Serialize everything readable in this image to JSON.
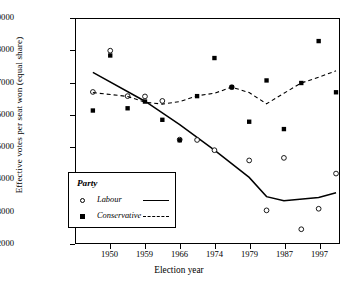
{
  "chart_data": {
    "type": "scatter",
    "title": "",
    "xlabel": "Election year",
    "ylabel": "Effective votes per seat won (equal share)",
    "ylim": [
      12000,
      19000
    ],
    "ytick_values": [
      12000,
      13000,
      14000,
      15000,
      16000,
      17000,
      18000,
      19000
    ],
    "ytick_labels": [
      "12000",
      "13000",
      "14000",
      "15000",
      "16000",
      "17000",
      "18000",
      "19000"
    ],
    "xtick_labels": [
      "1950",
      "1959",
      "1966",
      "1974",
      "1979",
      "1987",
      "1997"
    ],
    "xtick_index": [
      1,
      3,
      5,
      7,
      9,
      11,
      13
    ],
    "x_categories": [
      "1945",
      "1950",
      "1951",
      "1955",
      "1959",
      "1964",
      "1966",
      "1970",
      "1974F",
      "1974O",
      "1979",
      "1983",
      "1987",
      "1992",
      "1997"
    ],
    "grid": false,
    "legend_position": "lower-left",
    "legend_title": "Party",
    "series": [
      {
        "name": "Labour",
        "marker": "open-circle",
        "line_style": "solid",
        "points": [
          {
            "xi": 0,
            "year": "1945",
            "value": 16720
          },
          {
            "xi": 1,
            "year": "1950",
            "value": 18010
          },
          {
            "xi": 2,
            "year": "1951",
            "value": 16590
          },
          {
            "xi": 3,
            "year": "1959",
            "value": 16580
          },
          {
            "xi": 4,
            "year": "1959",
            "value": 16440
          },
          {
            "xi": 5,
            "year": "1964",
            "value": 15230
          },
          {
            "xi": 6,
            "year": "1966",
            "value": 15220
          },
          {
            "xi": 7,
            "year": "1970",
            "value": 14900
          },
          {
            "xi": 8,
            "year": "1974",
            "value": 16870
          },
          {
            "xi": 9,
            "year": "1974",
            "value": 14580
          },
          {
            "xi": 10,
            "year": "1979",
            "value": 13020
          },
          {
            "xi": 11,
            "year": "1983",
            "value": 14660
          },
          {
            "xi": 12,
            "year": "1987",
            "value": 12430
          },
          {
            "xi": 13,
            "year": "1992",
            "value": 13070
          },
          {
            "xi": 14,
            "year": "1997",
            "value": 14170
          },
          {
            "xi": 15,
            "year": "1997",
            "value": 13320
          }
        ],
        "trend": [
          {
            "xi": 0,
            "value": 17330
          },
          {
            "xi": 3,
            "value": 16430
          },
          {
            "xi": 5,
            "value": 15700
          },
          {
            "xi": 7,
            "value": 14900
          },
          {
            "xi": 9,
            "value": 14050
          },
          {
            "xi": 10,
            "value": 13450
          },
          {
            "xi": 11,
            "value": 13320
          },
          {
            "xi": 13,
            "value": 13420
          },
          {
            "xi": 14,
            "value": 13570
          }
        ]
      },
      {
        "name": "Conservative",
        "marker": "filled-square",
        "line_style": "dashed",
        "points": [
          {
            "xi": 0,
            "year": "1945",
            "value": 16140
          },
          {
            "xi": 1,
            "year": "1950",
            "value": 17860
          },
          {
            "xi": 2,
            "year": "1951",
            "value": 16210
          },
          {
            "xi": 3,
            "year": "1959",
            "value": 16420
          },
          {
            "xi": 4,
            "year": "1964",
            "value": 15850
          },
          {
            "xi": 5,
            "year": "1966",
            "value": 15210
          },
          {
            "xi": 6,
            "year": "1966",
            "value": 16590
          },
          {
            "xi": 7,
            "year": "1970",
            "value": 17780
          },
          {
            "xi": 8,
            "year": "1974",
            "value": 16870
          },
          {
            "xi": 9,
            "year": "1974",
            "value": 15790
          },
          {
            "xi": 10,
            "year": "1979",
            "value": 17080
          },
          {
            "xi": 11,
            "year": "1983",
            "value": 15560
          },
          {
            "xi": 12,
            "year": "1987",
            "value": 17000
          },
          {
            "xi": 13,
            "year": "1992",
            "value": 18310
          },
          {
            "xi": 14,
            "year": "1997",
            "value": 16710
          }
        ],
        "trend": [
          {
            "xi": 0,
            "value": 16700
          },
          {
            "xi": 2,
            "value": 16580
          },
          {
            "xi": 3,
            "value": 16400
          },
          {
            "xi": 4,
            "value": 16340
          },
          {
            "xi": 5,
            "value": 16420
          },
          {
            "xi": 6,
            "value": 16600
          },
          {
            "xi": 7,
            "value": 16680
          },
          {
            "xi": 8,
            "value": 16870
          },
          {
            "xi": 9,
            "value": 16700
          },
          {
            "xi": 10,
            "value": 16350
          },
          {
            "xi": 11,
            "value": 16680
          },
          {
            "xi": 12,
            "value": 17000
          },
          {
            "xi": 13,
            "value": 17180
          },
          {
            "xi": 14,
            "value": 17380
          }
        ]
      }
    ]
  },
  "axes": {
    "x_title": "Election year",
    "y_title": "Effective votes per seat won (equal share)"
  },
  "legend": {
    "title": "Party",
    "entries": [
      {
        "label": "Labour",
        "marker": "open-circle",
        "line": "solid"
      },
      {
        "label": "Conservative",
        "marker": "filled-square",
        "line": "dashed"
      }
    ]
  },
  "colors": {
    "ink": "#000000",
    "background": "#ffffff"
  }
}
